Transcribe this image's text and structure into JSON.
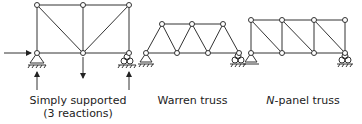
{
  "diagrams": [
    {
      "name": "simply-supported-truss",
      "caption_line1": "Simply supported",
      "caption_line2": "(3 reactions)"
    },
    {
      "name": "warren-truss",
      "caption": "Warren truss"
    },
    {
      "name": "n-panel-truss",
      "caption_prefix": "N",
      "caption_suffix": "-panel truss"
    }
  ]
}
